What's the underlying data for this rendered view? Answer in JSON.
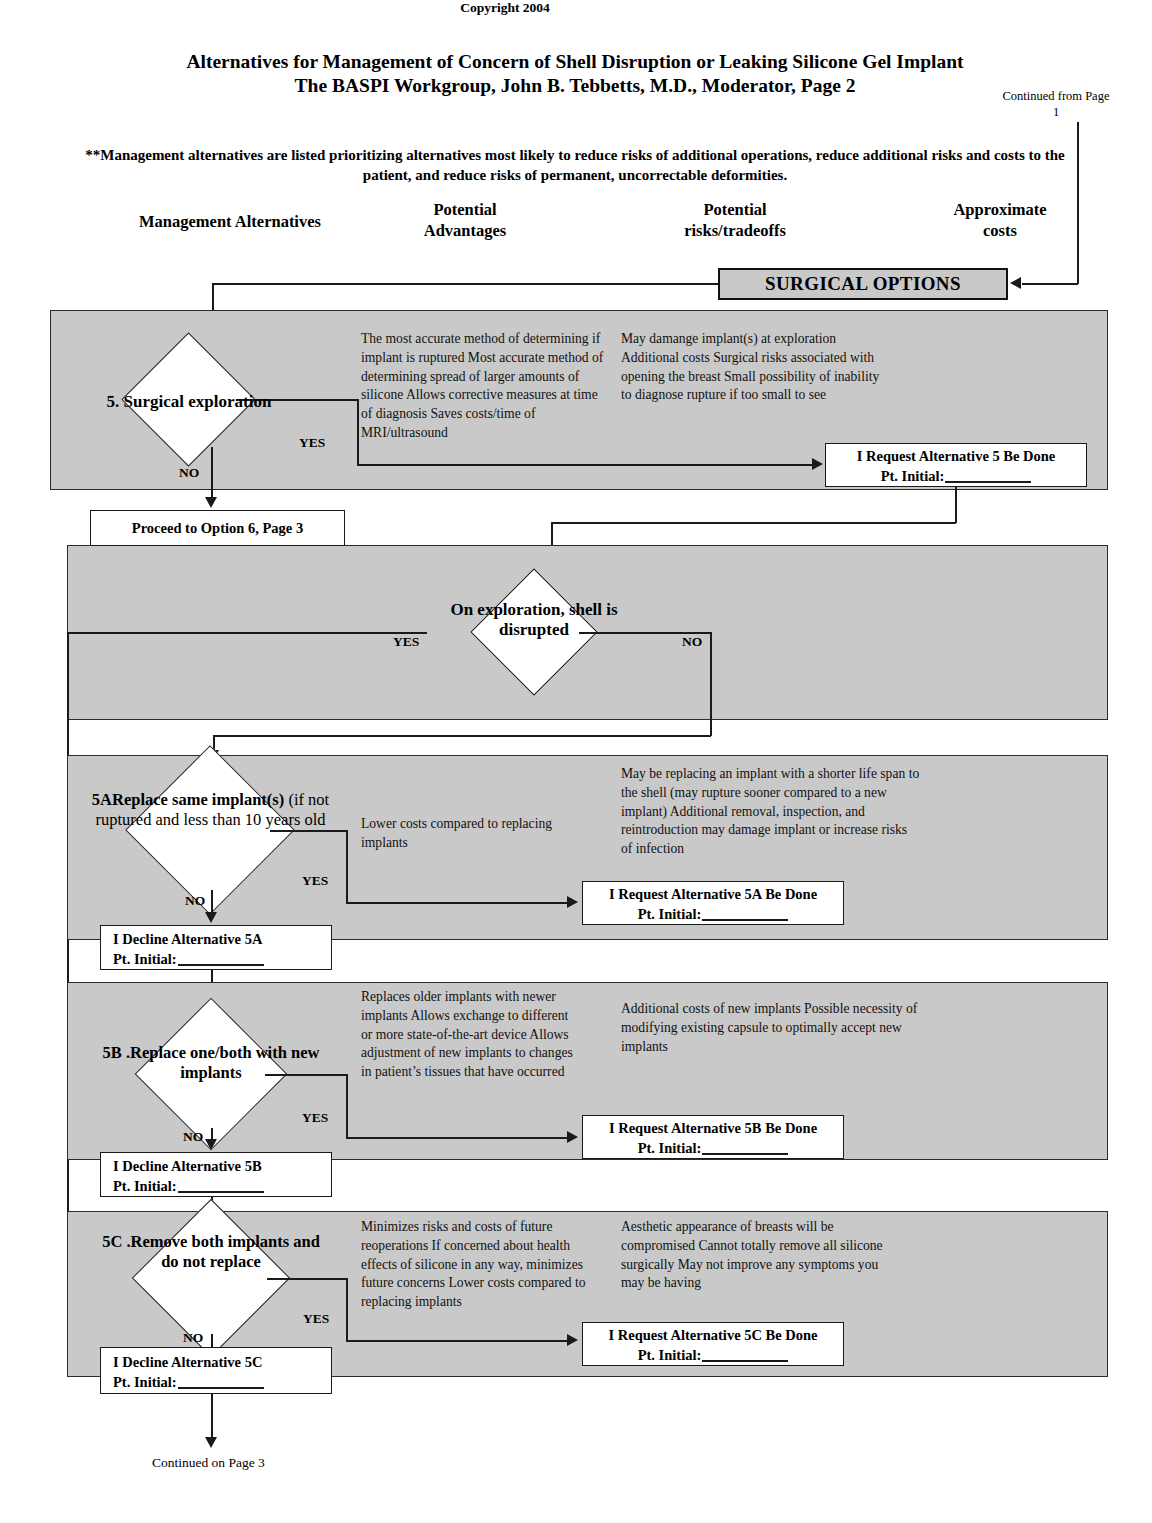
{
  "header": {
    "title_line1": "Alternatives for Management of Concern of Shell Disruption or Leaking Silicone Gel Implant",
    "title_line2": "The BASPI Workgroup, John B. Tebbetts, M.D., Moderator, Page 2",
    "copyright": "Copyright 2004",
    "continued_from": "Continued from Page 1",
    "note": "**Management alternatives are listed prioritizing alternatives most likely to reduce risks of additional operations, reduce additional risks and costs to the patient, and reduce risks of permanent, uncorrectable deformities.",
    "columns": [
      {
        "label": "Management Alternatives"
      },
      {
        "label": "Potential\nAdvantages"
      },
      {
        "label": "Potential\nrisks/tradeoffs"
      },
      {
        "label": "Approximate\ncosts"
      }
    ]
  },
  "surgical_options_banner": "SURGICAL OPTIONS",
  "labels": {
    "yes": "YES",
    "no": "NO"
  },
  "sections": {
    "five": {
      "decision": "5. Surgical exploration",
      "advantages": "The most accurate method of determining if implant is ruptured\nMost accurate method of determining spread of larger amounts of silicone\nAllows corrective measures at time of diagnosis\nSaves costs/time of MRI/ultrasound",
      "risks": "May damange implant(s) at exploration\nAdditional costs\nSurgical risks associated with opening the breast\nSmall possibility of inability to diagnose rupture if too small to see",
      "request_line1": "I Request Alternative 5 Be Done",
      "request_line2": "Pt. Initial:",
      "proceed": "Proceed to Option 6, Page 3"
    },
    "exploration": {
      "decision": "On exploration, shell is disrupted"
    },
    "fiveA": {
      "decision_bold": "5AReplace same implant(s)",
      "decision_regular": "(if not ruptured and less than 10 years old",
      "advantages": "Lower costs compared to replacing implants",
      "risks": "May be replacing an implant with a shorter life span to the shell (may rupture sooner compared to a new implant)\nAdditional removal, inspection, and reintroduction may damage implant or increase risks of infection",
      "request_line1": "I Request Alternative 5A Be Done",
      "request_line2": "Pt. Initial:",
      "decline_line1": "I Decline Alternative 5A",
      "decline_line2": "Pt. Initial:"
    },
    "fiveB": {
      "decision": "5B .Replace one/both with new implants",
      "advantages": "Replaces older implants with newer implants\nAllows exchange to different or more state-of-the-art device\nAllows adjustment of new implants to changes in patient’s tissues that have occurred",
      "risks": "Additional costs of new implants\nPossible necessity of modifying existing capsule to optimally accept new implants",
      "request_line1": "I Request Alternative 5B Be Done",
      "request_line2": "Pt. Initial:",
      "decline_line1": "I Decline Alternative 5B",
      "decline_line2": "Pt. Initial:"
    },
    "fiveC": {
      "decision": "5C .Remove both implants and do not replace",
      "advantages": "Minimizes risks and costs of future reoperations\nIf concerned about health effects of silicone in any way, minimizes future concerns\nLower costs compared to replacing implants",
      "risks": "Aesthetic appearance of breasts will be compromised\nCannot totally remove all silicone surgically\nMay not improve any symptoms you may be having",
      "request_line1": "I Request Alternative 5C Be Done",
      "request_line2": "Pt. Initial:",
      "decline_line1": "I Decline Alternative 5C",
      "decline_line2": "Pt. Initial:"
    }
  },
  "footer": {
    "continued_on": "Continued on Page 3"
  },
  "colors": {
    "band_fill": "#c9c9c9",
    "line": "#1a1a1a",
    "paper": "#ffffff"
  }
}
